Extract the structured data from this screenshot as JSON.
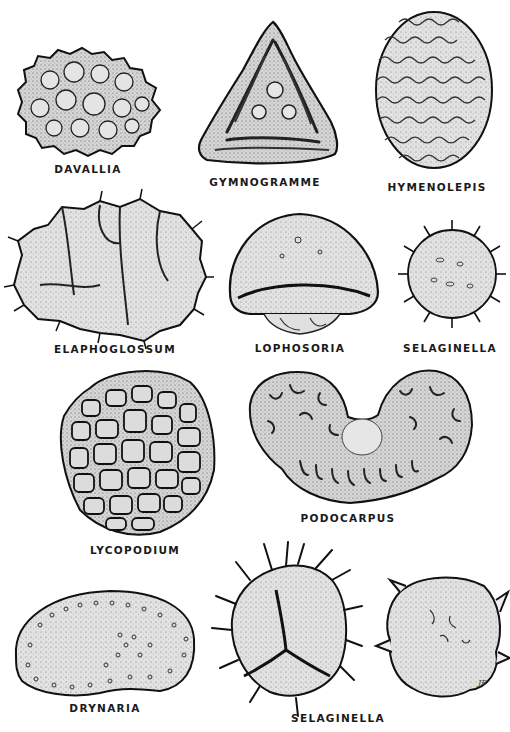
{
  "plate": {
    "background": "#ffffff",
    "ink_color": "#1a1a1a",
    "fill_color": "#d9d9d9",
    "specimens": [
      {
        "id": "davallia",
        "label": "DAVALLIA",
        "shape": "warty-bean"
      },
      {
        "id": "gymnogramme",
        "label": "GYMNOGRAMME",
        "shape": "triangular-trilete"
      },
      {
        "id": "hymenolepis",
        "label": "HYMENOLEPIS",
        "shape": "oval-verrucate"
      },
      {
        "id": "elaphoglossum",
        "label": "ELAPHOGLOSSUM",
        "shape": "folded-spiny"
      },
      {
        "id": "lophosoria",
        "label": "LOPHOSORIA",
        "shape": "dome-cingulate"
      },
      {
        "id": "selaginella-1",
        "label": "SELAGINELLA",
        "shape": "round-echinate"
      },
      {
        "id": "lycopodium",
        "label": "LYCOPODIUM",
        "shape": "reticulate-round"
      },
      {
        "id": "podocarpus",
        "label": "PODOCARPUS",
        "shape": "bisaccate"
      },
      {
        "id": "drynaria",
        "label": "DRYNARIA",
        "shape": "bean-verrucate"
      },
      {
        "id": "selaginella-2",
        "label": "SELAGINELLA",
        "shape": "spiny-trilete-pair"
      }
    ],
    "signature": "JF"
  }
}
